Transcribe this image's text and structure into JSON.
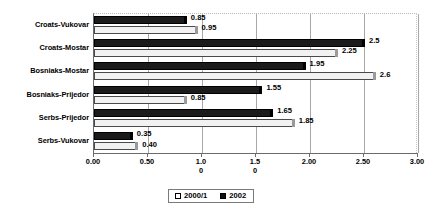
{
  "chart_data": {
    "type": "bar",
    "orientation": "horizontal",
    "title": "",
    "xlabel": "",
    "ylabel": "",
    "xlim": [
      0,
      3.0
    ],
    "grid": true,
    "legend_position": "bottom",
    "categories": [
      "Croats-Vukovar",
      "Croats-Mostar",
      "Bosniaks-Mostar",
      "Bosniaks-Prijedor",
      "Serbs-Prijedor",
      "Serbs-Vukovar"
    ],
    "series": [
      {
        "name": "2002",
        "color": "#1b1b1b",
        "values": [
          0.85,
          2.5,
          1.95,
          1.55,
          1.65,
          0.35
        ],
        "labels": [
          "0.85",
          "2.5",
          "1.95",
          "1.55",
          "1.65",
          "0.35"
        ]
      },
      {
        "name": "2000/1",
        "color": "#f2f2f2",
        "values": [
          0.95,
          2.25,
          2.6,
          0.85,
          1.85,
          0.4
        ],
        "labels": [
          "0.95",
          "2.25",
          "2.6",
          "0.85",
          "1.85",
          "0.40"
        ]
      }
    ],
    "xticks": [
      0,
      0.5,
      1.0,
      1.5,
      2.0,
      2.5,
      3.0
    ],
    "xtick_labels": [
      "0.00",
      "0.50",
      "1.0\n0",
      "1.5\n0",
      "2.00",
      "2.50",
      "3.00"
    ]
  },
  "axis": {
    "ticks": [
      {
        "value": 0,
        "line1": "0.00",
        "line2": ""
      },
      {
        "value": 0.5,
        "line1": "0.50",
        "line2": ""
      },
      {
        "value": 1.0,
        "line1": "1.0",
        "line2": "0"
      },
      {
        "value": 1.5,
        "line1": "1.5",
        "line2": "0"
      },
      {
        "value": 2.0,
        "line1": "2.00",
        "line2": ""
      },
      {
        "value": 2.5,
        "line1": "2.50",
        "line2": ""
      },
      {
        "value": 3.0,
        "line1": "3.00",
        "line2": ""
      }
    ]
  },
  "legend": {
    "items": [
      {
        "label": "2000/1",
        "swatch": "hollow"
      },
      {
        "label": "2002",
        "swatch": "solid"
      }
    ]
  }
}
